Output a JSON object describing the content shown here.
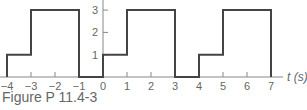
{
  "figure": {
    "caption": "Figure P 11.4-3",
    "xlabel": "t (s)"
  },
  "chart_data": {
    "type": "line",
    "title": "",
    "xlabel": "t (s)",
    "ylabel": "",
    "step": true,
    "x_ticks": [
      -4,
      -3,
      -2,
      -1,
      0,
      1,
      2,
      3,
      4,
      5,
      6,
      7
    ],
    "y_ticks": [
      1,
      2,
      3
    ],
    "xlim": [
      -4,
      7.5
    ],
    "ylim": [
      0,
      3
    ],
    "grid": false,
    "legend": null,
    "segments": [
      {
        "t_start": -4,
        "t_end": -3,
        "value": 1
      },
      {
        "t_start": -3,
        "t_end": -1,
        "value": 3
      },
      {
        "t_start": -1,
        "t_end": 0,
        "value": 0
      },
      {
        "t_start": 0,
        "t_end": 1,
        "value": 1
      },
      {
        "t_start": 1,
        "t_end": 3,
        "value": 3
      },
      {
        "t_start": 3,
        "t_end": 4,
        "value": 0
      },
      {
        "t_start": 4,
        "t_end": 5,
        "value": 1
      },
      {
        "t_start": 5,
        "t_end": 7,
        "value": 3
      }
    ],
    "x": [
      -4,
      -4,
      -3,
      -3,
      -1,
      -1,
      0,
      0,
      1,
      1,
      3,
      3,
      4,
      4,
      5,
      5,
      7,
      7
    ],
    "y": [
      0,
      1,
      1,
      3,
      3,
      0,
      0,
      1,
      1,
      3,
      3,
      0,
      0,
      1,
      1,
      3,
      3,
      0
    ],
    "colors": {
      "line": "#444444",
      "axis": "#888888"
    }
  }
}
